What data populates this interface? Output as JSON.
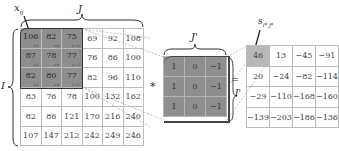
{
  "labels": {
    "input_element": "x",
    "input_element_sub": "ij",
    "input_width": "J",
    "input_height": "I",
    "kernel_width": "J'",
    "kernel_height": "I'",
    "output_element": "s",
    "output_element_sub": "i* j*",
    "convolve_operator": "*",
    "equals_operator": "="
  },
  "input_matrix": {
    "rows": [
      [
        106,
        82,
        75,
        69,
        92,
        108
      ],
      [
        87,
        78,
        77,
        76,
        86,
        100
      ],
      [
        82,
        80,
        77,
        82,
        96,
        110
      ],
      [
        83,
        76,
        78,
        100,
        132,
        162
      ],
      [
        82,
        86,
        121,
        170,
        216,
        240
      ],
      [
        107,
        147,
        212,
        242,
        249,
        246
      ]
    ],
    "highlighted_window": {
      "rows": [
        0,
        2
      ],
      "cols": [
        0,
        2
      ]
    },
    "window_weight_annotations": [
      [
        "×1",
        "×0",
        "×−1"
      ],
      [
        "×1",
        "×0",
        "×−1"
      ],
      [
        "×1",
        "×0",
        "×−1"
      ]
    ]
  },
  "kernel_matrix": {
    "rows": [
      [
        "1",
        "0",
        "−1"
      ],
      [
        "1",
        "0",
        "−1"
      ],
      [
        "1",
        "0",
        "−1"
      ]
    ]
  },
  "output_matrix": {
    "rows": [
      [
        "46",
        "13",
        "−45",
        "−91"
      ],
      [
        "20",
        "−24",
        "−82",
        "−114"
      ],
      [
        "−29",
        "−110",
        "−168",
        "−160"
      ],
      [
        "−139",
        "−203",
        "−186",
        "−136"
      ]
    ],
    "highlighted_cell": {
      "row": 0,
      "col": 0
    }
  },
  "colors": {
    "highlight_dark": "#8e8e8e",
    "highlight_light": "#b8b8b8",
    "grid_line": "#bdbdbd"
  }
}
